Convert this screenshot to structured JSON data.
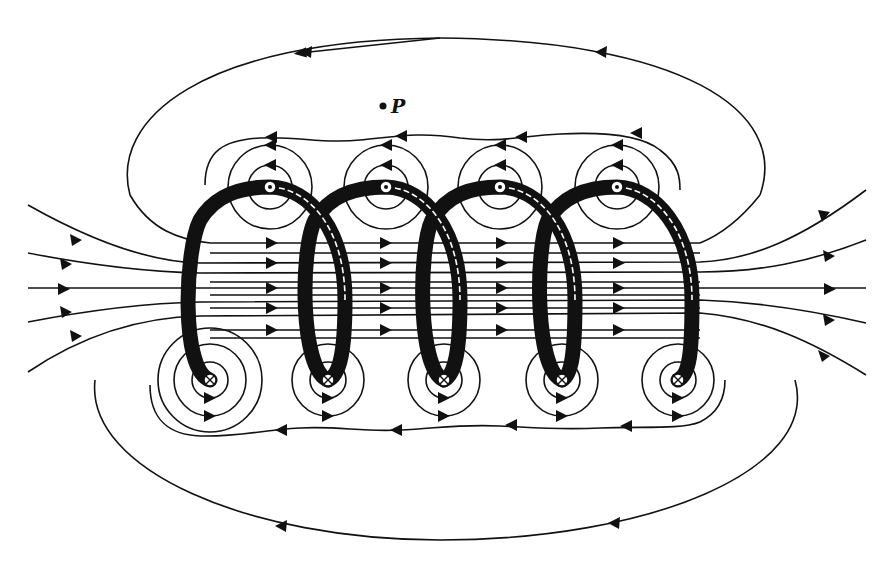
{
  "figure": {
    "point_label": "P",
    "colors": {
      "ink": "#111111",
      "background": "#ffffff"
    },
    "turns": 5,
    "current_out_symbol": "⊙",
    "current_in_symbol": "⊗",
    "top_conductors_x": [
      270,
      386,
      500,
      617
    ],
    "bottom_conductors_x": [
      210,
      328,
      444,
      562,
      678
    ],
    "top_conductors_y": 187,
    "bottom_conductors_y": 380,
    "point_P": {
      "x": 383,
      "y": 106
    }
  }
}
